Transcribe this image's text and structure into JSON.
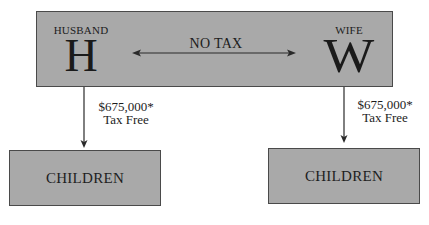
{
  "diagram": {
    "top_box": {
      "husband": {
        "role": "HUSBAND",
        "initial": "H"
      },
      "wife": {
        "role": "WIFE",
        "initial": "W"
      },
      "transfer_label": "NO TAX"
    },
    "flows": [
      {
        "from": "HUSBAND",
        "to": "CHILDREN",
        "amount": "$675,000*",
        "note": "Tax Free"
      },
      {
        "from": "WIFE",
        "to": "CHILDREN",
        "amount": "$675,000*",
        "note": "Tax Free"
      }
    ],
    "children_boxes": [
      {
        "label": "CHILDREN"
      },
      {
        "label": "CHILDREN"
      }
    ],
    "colors": {
      "box_fill": "#a9a9a9",
      "box_border": "#4a4a4a",
      "text": "#1c1c1c",
      "arrow": "#2a2a2a"
    }
  }
}
